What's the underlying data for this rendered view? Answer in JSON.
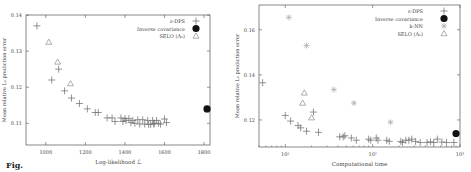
{
  "chart_data": [
    {
      "type": "scatter",
      "title": "",
      "xlabel": "Log-likelihood ℒ",
      "ylabel": "Mean relative L₁ prediction error",
      "xlim": [
        900,
        1830
      ],
      "ylim": [
        0.104,
        0.14
      ],
      "xticks": [
        1000,
        1200,
        1400,
        1600,
        1800
      ],
      "xtick_labels": [
        "1000",
        "1200",
        "1400",
        "1600",
        "1800"
      ],
      "yticks": [
        0.11,
        0.12,
        0.13,
        0.14
      ],
      "ytick_labels": [
        "0.11",
        "0.12",
        "0.13",
        "0.14"
      ],
      "grid": false,
      "legend_position": "upper right",
      "series": [
        {
          "name": "ε-DPS",
          "marker": "plus",
          "points": [
            [
              955,
              0.137
            ],
            [
              1030,
              0.122
            ],
            [
              1065,
              0.125
            ],
            [
              1095,
              0.119
            ],
            [
              1130,
              0.117
            ],
            [
              1170,
              0.1155
            ],
            [
              1210,
              0.114
            ],
            [
              1250,
              0.113
            ],
            [
              1265,
              0.113
            ],
            [
              1310,
              0.1115
            ],
            [
              1335,
              0.1115
            ],
            [
              1350,
              0.1105
            ],
            [
              1380,
              0.1115
            ],
            [
              1390,
              0.1105
            ],
            [
              1400,
              0.1113
            ],
            [
              1405,
              0.1108
            ],
            [
              1420,
              0.1113
            ],
            [
              1430,
              0.1102
            ],
            [
              1440,
              0.1108
            ],
            [
              1450,
              0.11
            ],
            [
              1465,
              0.111
            ],
            [
              1475,
              0.1098
            ],
            [
              1490,
              0.111
            ],
            [
              1500,
              0.1098
            ],
            [
              1515,
              0.1108
            ],
            [
              1520,
              0.1097
            ],
            [
              1530,
              0.1097
            ],
            [
              1540,
              0.1108
            ],
            [
              1545,
              0.1098
            ],
            [
              1550,
              0.11
            ],
            [
              1560,
              0.1108
            ],
            [
              1570,
              0.11
            ],
            [
              1580,
              0.1098
            ],
            [
              1600,
              0.1112
            ],
            [
              1610,
              0.1102
            ]
          ]
        },
        {
          "name": "Inverse covariance",
          "marker": "filled-circle",
          "points": [
            [
              1815,
              0.114
            ]
          ]
        },
        {
          "name": "SELO (Λ₀)",
          "marker": "triangle",
          "points": [
            [
              1015,
              0.1325
            ],
            [
              1060,
              0.127
            ],
            [
              1125,
              0.121
            ]
          ]
        }
      ]
    },
    {
      "type": "scatter",
      "title": "",
      "xlabel": "Computational time",
      "ylabel": "Mean relative L₁ prediction error",
      "xscale": "log",
      "xlim": [
        50,
        10000
      ],
      "ylim": [
        0.108,
        0.171
      ],
      "xticks": [
        100,
        1000,
        10000
      ],
      "xtick_labels": [
        "10²",
        "10³",
        "10⁴"
      ],
      "yticks": [
        0.12,
        0.14,
        0.16
      ],
      "ytick_labels": [
        "0.12",
        "0.14",
        "0.16"
      ],
      "grid": false,
      "legend_position": "upper right",
      "series": [
        {
          "name": "ε-DPS",
          "marker": "plus",
          "points": [
            [
              55,
              0.1365
            ],
            [
              100,
              0.122
            ],
            [
              115,
              0.1195
            ],
            [
              140,
              0.1175
            ],
            [
              150,
              0.1165
            ],
            [
              175,
              0.115
            ],
            [
              210,
              0.1235
            ],
            [
              240,
              0.1145
            ],
            [
              420,
              0.1125
            ],
            [
              460,
              0.1125
            ],
            [
              480,
              0.113
            ],
            [
              570,
              0.112
            ],
            [
              650,
              0.111
            ],
            [
              900,
              0.1115
            ],
            [
              950,
              0.111
            ],
            [
              1100,
              0.112
            ],
            [
              1150,
              0.111
            ],
            [
              1450,
              0.111
            ],
            [
              1550,
              0.1105
            ],
            [
              2100,
              0.1105
            ],
            [
              2200,
              0.11
            ],
            [
              2400,
              0.111
            ],
            [
              2600,
              0.111
            ],
            [
              2800,
              0.1115
            ],
            [
              3100,
              0.1105
            ],
            [
              3500,
              0.11
            ],
            [
              4200,
              0.11
            ],
            [
              4600,
              0.1103
            ],
            [
              5000,
              0.11
            ],
            [
              5500,
              0.1115
            ],
            [
              6200,
              0.1102
            ],
            [
              7000,
              0.11
            ],
            [
              8500,
              0.11
            ]
          ]
        },
        {
          "name": "Inverse covariance",
          "marker": "filled-circle",
          "points": [
            [
              9000,
              0.114
            ]
          ]
        },
        {
          "name": "k-NN",
          "marker": "asterisk",
          "points": [
            [
              110,
              0.1655
            ],
            [
              175,
              0.153
            ],
            [
              360,
              0.1335
            ],
            [
              610,
              0.1275
            ],
            [
              1600,
              0.119
            ]
          ]
        },
        {
          "name": "SELO (Λ₀)",
          "marker": "triangle",
          "points": [
            [
              165,
              0.132
            ],
            [
              158,
              0.1275
            ],
            [
              200,
              0.121
            ]
          ]
        }
      ]
    }
  ],
  "left_chart": {
    "xlabel": "Log-likelihood ℒ",
    "ylabel": "Mean relative L₁ prediction error",
    "legend": [
      "ε-DPS",
      "Inverse covariance",
      "SELO (Λ₀)"
    ]
  },
  "right_chart": {
    "xlabel": "Computational time",
    "ylabel": "Mean relative L₁ prediction error",
    "legend": [
      "ε-DPS",
      "Inverse covariance",
      "k-NN",
      "SELO (Λ₀)"
    ]
  },
  "caption": {
    "text": "Fig."
  },
  "colors": {
    "axis": "#555555",
    "plus": "#777777",
    "triangle": "#999999",
    "asterisk": "#aaaaaa",
    "circle": "#111111"
  }
}
